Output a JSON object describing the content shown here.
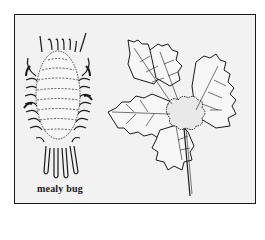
{
  "illustration": {
    "caption": "mealy bug",
    "subjects": [
      "mealy-bug",
      "infested-leaf-cluster"
    ],
    "colors": {
      "ink": "#1a1a1a",
      "panel": "#f2f2f2",
      "page": "#ffffff"
    }
  }
}
